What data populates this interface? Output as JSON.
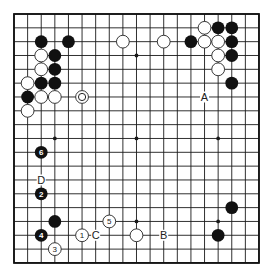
{
  "board": {
    "size": 19,
    "origin_x": 14,
    "origin_y": 14,
    "spacing_x": 13.61,
    "spacing_y": 13.83,
    "colors": {
      "black": "#111111",
      "white": "#ffffff",
      "line": "#1a1a1a"
    },
    "star_points": [
      [
        3,
        3
      ],
      [
        9,
        3
      ],
      [
        15,
        3
      ],
      [
        3,
        9
      ],
      [
        9,
        9
      ],
      [
        15,
        9
      ],
      [
        3,
        15
      ],
      [
        9,
        15
      ],
      [
        15,
        15
      ]
    ],
    "stones": [
      {
        "color": "black",
        "col": 2,
        "row": 2
      },
      {
        "color": "black",
        "col": 4,
        "row": 2
      },
      {
        "color": "white",
        "col": 8,
        "row": 2
      },
      {
        "color": "white",
        "col": 2,
        "row": 3
      },
      {
        "color": "black",
        "col": 3,
        "row": 3
      },
      {
        "color": "white",
        "col": 2,
        "row": 4
      },
      {
        "color": "black",
        "col": 3,
        "row": 4
      },
      {
        "color": "white",
        "col": 1,
        "row": 5
      },
      {
        "color": "black",
        "col": 2,
        "row": 5
      },
      {
        "color": "black",
        "col": 3,
        "row": 5
      },
      {
        "color": "black",
        "col": 1,
        "row": 6
      },
      {
        "color": "white",
        "col": 2,
        "row": 6
      },
      {
        "color": "white",
        "col": 3,
        "row": 6
      },
      {
        "color": "white",
        "col": 5,
        "row": 6,
        "marker": "circle"
      },
      {
        "color": "white",
        "col": 1,
        "row": 7
      },
      {
        "color": "white",
        "col": 14,
        "row": 1
      },
      {
        "color": "black",
        "col": 15,
        "row": 1
      },
      {
        "color": "black",
        "col": 16,
        "row": 1
      },
      {
        "color": "white",
        "col": 11,
        "row": 2
      },
      {
        "color": "black",
        "col": 13,
        "row": 2
      },
      {
        "color": "white",
        "col": 14,
        "row": 2
      },
      {
        "color": "white",
        "col": 15,
        "row": 2
      },
      {
        "color": "black",
        "col": 16,
        "row": 2
      },
      {
        "color": "white",
        "col": 15,
        "row": 3
      },
      {
        "color": "black",
        "col": 16,
        "row": 3
      },
      {
        "color": "white",
        "col": 15,
        "row": 4
      },
      {
        "color": "black",
        "col": 16,
        "row": 5
      },
      {
        "color": "black",
        "col": 2,
        "row": 10,
        "number": "6"
      },
      {
        "color": "black",
        "col": 2,
        "row": 13,
        "number": "2"
      },
      {
        "color": "black",
        "col": 3,
        "row": 15
      },
      {
        "color": "black",
        "col": 2,
        "row": 16,
        "number": "4"
      },
      {
        "color": "white",
        "col": 3,
        "row": 17,
        "number": "3"
      },
      {
        "color": "white",
        "col": 5,
        "row": 16,
        "number": "1"
      },
      {
        "color": "white",
        "col": 7,
        "row": 15,
        "number": "5"
      },
      {
        "color": "white",
        "col": 9,
        "row": 16
      },
      {
        "color": "black",
        "col": 16,
        "row": 14
      },
      {
        "color": "black",
        "col": 15,
        "row": 16
      }
    ],
    "labels": [
      {
        "text": "A",
        "col": 14,
        "row": 6
      },
      {
        "text": "B",
        "col": 11,
        "row": 16
      },
      {
        "text": "C",
        "col": 6,
        "row": 16
      },
      {
        "text": "D",
        "col": 2,
        "row": 12
      }
    ]
  }
}
